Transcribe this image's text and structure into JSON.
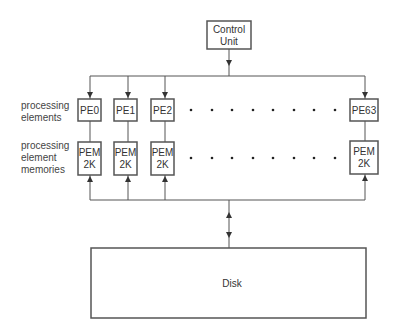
{
  "diagram": {
    "control_unit": {
      "line1": "Control",
      "line2": "Unit"
    },
    "row_labels": {
      "pe": {
        "line1": "processing",
        "line2": "elements"
      },
      "pem": {
        "line1": "processing",
        "line2": "element",
        "line3": "memories"
      }
    },
    "processing_elements": [
      {
        "label": "PE0"
      },
      {
        "label": "PE1"
      },
      {
        "label": "PE2"
      },
      {
        "label": "PE63"
      }
    ],
    "memories": [
      {
        "line1": "PEM",
        "line2": "2K"
      },
      {
        "line1": "PEM",
        "line2": "2K"
      },
      {
        "line1": "PEM",
        "line2": "2K"
      },
      {
        "line1": "PEM",
        "line2": "2K"
      }
    ],
    "ellipsis_dots_per_row": 8,
    "disk": {
      "label": "Disk"
    },
    "colors": {
      "line": "#555555",
      "text": "#333333",
      "background": "#ffffff"
    }
  }
}
